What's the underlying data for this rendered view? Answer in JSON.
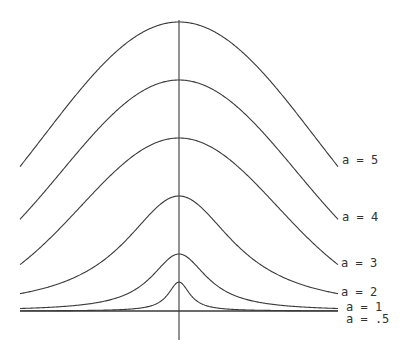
{
  "chart_data": {
    "type": "line",
    "title": "",
    "xlabel": "",
    "ylabel": "",
    "grid": false,
    "legend": "inline labels at right end of each curve",
    "axes": {
      "x_axis": {
        "y_px": 311,
        "x_start_px": 20,
        "x_end_px": 338
      },
      "y_axis": {
        "x_px": 179,
        "y_start_px": 20,
        "y_end_px": 340
      }
    },
    "series": [
      {
        "name": "a = 5",
        "a": 5,
        "peak_px": 289,
        "shape": "gaussian",
        "width_px": 135
      },
      {
        "name": "a = 4",
        "a": 4,
        "peak_px": 231,
        "shape": "gaussian",
        "width_px": 117
      },
      {
        "name": "a = 3",
        "a": 3,
        "peak_px": 173,
        "shape": "gaussian",
        "width_px": 98
      },
      {
        "name": "a = 2",
        "a": 2,
        "peak_px": 115,
        "shape": "lorentzian",
        "width_px": 67
      },
      {
        "name": "a = 1",
        "a": 1,
        "peak_px": 57,
        "shape": "lorentzian",
        "width_px": 34
      },
      {
        "name": "a = .5",
        "a": 0.5,
        "peak_px": 29,
        "shape": "lorentzian",
        "width_px": 13
      }
    ]
  },
  "labels": [
    {
      "text": "a = 5",
      "x": 342,
      "y": 154
    },
    {
      "text": "a = 4",
      "x": 342,
      "y": 211
    },
    {
      "text": "a = 3",
      "x": 341,
      "y": 257
    },
    {
      "text": "a = 2",
      "x": 341,
      "y": 286
    },
    {
      "text": "a = 1",
      "x": 346,
      "y": 301
    },
    {
      "text": "a = .5",
      "x": 346,
      "y": 313
    }
  ]
}
